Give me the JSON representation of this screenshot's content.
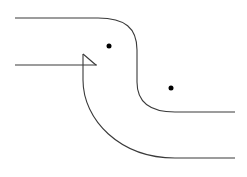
{
  "diagram": {
    "stroke_color": "#3a3a3a",
    "dot_color": "#000000",
    "background": "#ffffff",
    "curves": [
      {
        "name": "upper-boundary",
        "d": "M15,18 L98,18 C125,18 137,28 137,50 L137,82 C137,102 150,112 175,112 L235,112"
      },
      {
        "name": "left-horizontal-line",
        "d": "M15,65 L97,65"
      },
      {
        "name": "cusp-diagonal",
        "d": "M83,54 C88,58 92,62 96,65"
      },
      {
        "name": "lower-boundary",
        "d": "M83,54 L83,80 C83,120 120,158 175,158 L235,158"
      }
    ],
    "points": [
      {
        "name": "point-upper",
        "cx": 109,
        "cy": 46,
        "r": 2.5
      },
      {
        "name": "point-lower",
        "cx": 171,
        "cy": 88,
        "r": 2.5
      }
    ]
  }
}
